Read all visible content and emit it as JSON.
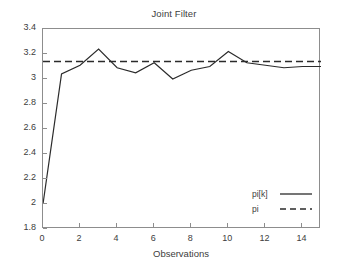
{
  "chart_data": {
    "type": "line",
    "title": "Joint Filter",
    "xlabel": "Observations",
    "ylabel": "",
    "xlim": [
      0,
      15
    ],
    "ylim": [
      1.8,
      3.4
    ],
    "xticks": [
      0,
      2,
      4,
      6,
      8,
      10,
      12,
      14
    ],
    "xtick_labels": [
      "0",
      "2",
      "4",
      "6",
      "8",
      "10",
      "12",
      "14"
    ],
    "yticks": [
      1.8,
      2.0,
      2.2,
      2.4,
      2.6,
      2.8,
      3.0,
      3.2,
      3.4
    ],
    "ytick_labels": [
      "1.8",
      "2",
      "2.2",
      "2.4",
      "2.6",
      "2.8",
      "3",
      "3.2",
      "3.4"
    ],
    "grid": false,
    "legend_position": "lower right",
    "series": [
      {
        "name": "pi[k]",
        "style": "solid",
        "color": "#2b2b2b",
        "x": [
          0,
          1,
          2,
          3,
          4,
          5,
          6,
          7,
          8,
          9,
          10,
          11,
          12,
          13,
          14,
          15
        ],
        "values": [
          2.0,
          3.04,
          3.11,
          3.24,
          3.09,
          3.05,
          3.13,
          3.0,
          3.07,
          3.1,
          3.22,
          3.13,
          3.11,
          3.09,
          3.1,
          3.1
        ]
      },
      {
        "name": "pi",
        "style": "dashed",
        "color": "#2b2b2b",
        "constant": 3.14,
        "x": [
          0,
          15
        ],
        "values": [
          3.14,
          3.14
        ]
      }
    ]
  },
  "legend": {
    "items": [
      {
        "label": "pi[k]",
        "style": "solid"
      },
      {
        "label": "pi",
        "style": "dashed"
      }
    ]
  }
}
